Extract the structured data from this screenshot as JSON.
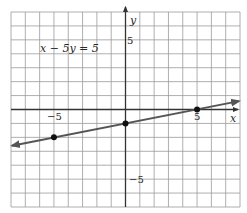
{
  "chart_data": {
    "type": "line",
    "title": "",
    "equation": "x − 5y = 5",
    "xlabel": "x",
    "ylabel": "y",
    "xlim": [
      -8,
      8
    ],
    "ylim": [
      -7,
      7
    ],
    "grid": true,
    "x_tick_labels": [
      {
        "value": -5,
        "label": "−5"
      },
      {
        "value": 5,
        "label": "5"
      }
    ],
    "y_tick_labels": [
      {
        "value": 5,
        "label": "5"
      },
      {
        "value": -5,
        "label": "−5"
      }
    ],
    "series": [
      {
        "name": "x − 5y = 5",
        "slope": 0.2,
        "intercept": -1,
        "x": [
          -8,
          8
        ],
        "y": [
          -2.6,
          0.6
        ],
        "arrows_both_ends": true,
        "color": "#555555"
      }
    ],
    "points": [
      {
        "x": -5,
        "y": -2
      },
      {
        "x": 0,
        "y": -1
      },
      {
        "x": 5,
        "y": 0
      }
    ],
    "colors": {
      "grid": "#9a9a9a",
      "axis": "#333333",
      "line": "#555555",
      "point": "#111111"
    }
  }
}
